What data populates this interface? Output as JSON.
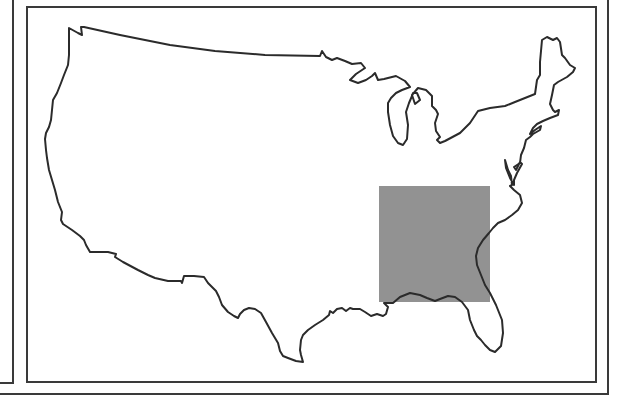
{
  "figure": {
    "type": "locator-map",
    "region_depicted": "contiguous United States",
    "highlight": {
      "description": "shaded rectangle over the southeastern United States",
      "fill": "#8c8c8c",
      "bounds_px": {
        "x": 379,
        "y": 186,
        "width": 111,
        "height": 116
      }
    },
    "outline_color": "#2b2b2b",
    "frame_color": "#3a3a3a",
    "background": "#ffffff"
  }
}
